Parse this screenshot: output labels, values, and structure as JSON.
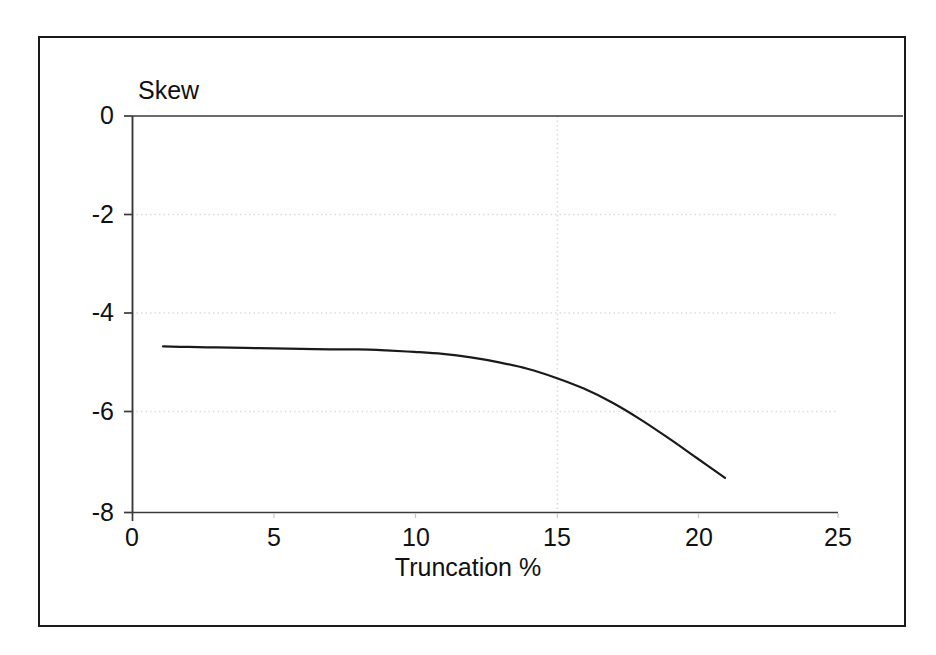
{
  "chart_data": {
    "type": "line",
    "title": "",
    "subtitle": "",
    "xlabel": "Truncation %",
    "ylabel": "Skew",
    "xlim": [
      0,
      25
    ],
    "ylim": [
      -8,
      0
    ],
    "xticks": [
      "0",
      "5",
      "10",
      "15",
      "20",
      "25"
    ],
    "xtick_values": [
      0,
      5,
      10,
      15,
      20,
      25
    ],
    "yticks": [
      "0",
      "-2",
      "-4",
      "-6",
      "-8"
    ],
    "ytick_values": [
      0,
      -2,
      -4,
      -6,
      -8
    ],
    "grid": true,
    "grid_style": "dotted",
    "grid_color": "#d9d9d9",
    "legend": false,
    "legend_position": "none",
    "line_color": "#1a1a1a",
    "line_width": 2,
    "annotations": [],
    "series": [
      {
        "name": "Skew",
        "x": [
          1.1,
          2.0,
          3.0,
          4.0,
          5.0,
          6.0,
          7.0,
          8.0,
          9.0,
          10.0,
          11.0,
          12.0,
          13.0,
          14.0,
          15.0,
          16.0,
          17.0,
          18.0,
          19.0,
          20.0,
          21.0
        ],
        "values": [
          -4.65,
          -4.66,
          -4.67,
          -4.68,
          -4.69,
          -4.7,
          -4.71,
          -4.71,
          -4.73,
          -4.76,
          -4.8,
          -4.87,
          -4.97,
          -5.1,
          -5.28,
          -5.5,
          -5.78,
          -6.12,
          -6.5,
          -6.9,
          -7.3
        ]
      }
    ]
  },
  "axes": {
    "y_axis_title": "Skew",
    "x_axis_title": "Truncation %"
  },
  "colors": {
    "frame": "#1a1a1a",
    "axis": "#333333",
    "grid": "#dcdcdc",
    "curve": "#1a1a1a",
    "background": "#ffffff",
    "text": "#111111"
  }
}
